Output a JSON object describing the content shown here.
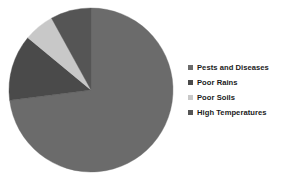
{
  "chart_data": {
    "type": "pie",
    "title": "",
    "subtitle": "",
    "xlabel": "",
    "ylabel": "",
    "grid": false,
    "legend_position": "right",
    "start_angle_deg": 0,
    "direction": "clockwise",
    "categories": [
      "Pests and Diseases",
      "Poor Rains",
      "Poor Soils",
      "High Temperatures"
    ],
    "values": [
      73,
      13,
      6,
      8
    ],
    "units": "percent",
    "colors": [
      "#6b6b6b",
      "#4a4a4a",
      "#c8c8c8",
      "#555555"
    ],
    "slices": [
      {
        "label": "Pests and Diseases",
        "value": 73,
        "color": "#6b6b6b"
      },
      {
        "label": "Poor Rains",
        "value": 13,
        "color": "#4a4a4a"
      },
      {
        "label": "Poor Soils",
        "value": 6,
        "color": "#c8c8c8"
      },
      {
        "label": "High Temperatures",
        "value": 8,
        "color": "#555555"
      }
    ],
    "annotations": []
  },
  "legend": {
    "items": [
      {
        "label": "Pests and Diseases",
        "color": "#6b6b6b"
      },
      {
        "label": "Poor Rains",
        "color": "#4a4a4a"
      },
      {
        "label": "Poor Soils",
        "color": "#c8c8c8"
      },
      {
        "label": "High Temperatures",
        "color": "#555555"
      }
    ]
  },
  "pie_geometry": {
    "center_x": 91,
    "center_y": 90,
    "radius": 82
  }
}
